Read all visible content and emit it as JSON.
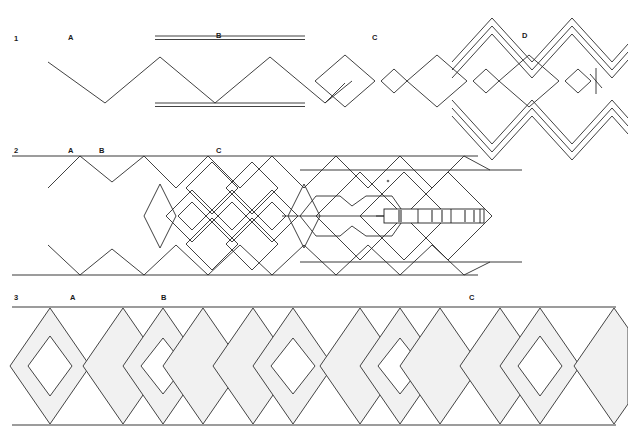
{
  "figure": {
    "background_color": "#ffffff",
    "line_color": "#2b2b2b",
    "shade_color": "#f1f1f1",
    "width": 628,
    "height": 434
  },
  "rows": [
    {
      "number": "1",
      "labels": [
        {
          "text": "A",
          "x": 68,
          "y": 40
        },
        {
          "text": "B",
          "x": 216,
          "y": 38
        },
        {
          "text": "C",
          "x": 372,
          "y": 40
        },
        {
          "text": "D",
          "x": 522,
          "y": 38
        }
      ],
      "row_number_pos": {
        "x": 14,
        "y": 41
      },
      "description": "Open zigzag chain at left, paired guide bars over region B, alternating large and small diamonds through C, nested chevron envelope with inner diamonds at D"
    },
    {
      "number": "2",
      "labels": [
        {
          "text": "A",
          "x": 68,
          "y": 153
        },
        {
          "text": "B",
          "x": 99,
          "y": 153
        },
        {
          "text": "C",
          "x": 216,
          "y": 153
        }
      ],
      "row_number_pos": {
        "x": 14,
        "y": 153
      },
      "description": "Bounded band with upper and lower rails, mirrored zigzags, dense overlapping diamond lattice, double-lobed hexagonal pointer and a segmented rectangular scale bar"
    },
    {
      "number": "3",
      "labels": [
        {
          "text": "A",
          "x": 70,
          "y": 300
        },
        {
          "text": "B",
          "x": 161,
          "y": 300
        },
        {
          "text": "C",
          "x": 469,
          "y": 300
        }
      ],
      "row_number_pos": {
        "x": 14,
        "y": 300
      },
      "description": "Bounded band of shaded diamonds alternating with open and hollow-cored diamonds"
    }
  ],
  "row1": {
    "zigzag": {
      "points": "48,62 105,103 160,57 215,103 270,57 325,103 380,57",
      "peak_y": 57,
      "valley_y": 103
    },
    "guide_bars": [
      {
        "x1": 155,
        "y1": 36,
        "x2": 305,
        "y2": 36
      },
      {
        "x1": 155,
        "y1": 39,
        "x2": 305,
        "y2": 39
      },
      {
        "x1": 155,
        "y1": 103,
        "x2": 305,
        "y2": 103
      },
      {
        "x1": 155,
        "y1": 106,
        "x2": 305,
        "y2": 106
      }
    ],
    "diamond_axis_y": 81,
    "diamonds": [
      {
        "cx": 345,
        "rx": 30,
        "ry": 26
      },
      {
        "cx": 394,
        "rx": 13,
        "ry": 12
      },
      {
        "cx": 437,
        "rx": 30,
        "ry": 26
      },
      {
        "cx": 486,
        "rx": 13,
        "ry": 12
      },
      {
        "cx": 529,
        "rx": 30,
        "ry": 26
      },
      {
        "cx": 578,
        "rx": 13,
        "ry": 12
      }
    ],
    "chevron_envelope": {
      "offsets": [
        0,
        4.5,
        9
      ],
      "upper_base": "455,58 492,16 530,58 568,16 606,58 628,36",
      "lower_base": "455,104 492,146 530,104 568,146 606,104 628,126"
    },
    "cross_mark": {
      "x": 596,
      "y": 81,
      "len": 13
    }
  },
  "row2": {
    "rails": [
      {
        "x1": 12,
        "y1": 155,
        "x2": 478,
        "y2": 155
      },
      {
        "x1": 12,
        "y1": 157,
        "x2": 478,
        "y2": 157
      },
      {
        "x1": 12,
        "y1": 274,
        "x2": 478,
        "y2": 274
      },
      {
        "x1": 12,
        "y1": 276,
        "x2": 478,
        "y2": 276
      }
    ],
    "rails_right": [
      {
        "x1": 300,
        "y1": 170,
        "x2": 520,
        "y2": 170
      },
      {
        "x1": 300,
        "y1": 262,
        "x2": 520,
        "y2": 262
      }
    ],
    "upper_zigzag": "48,188 80,156 112,181 144,156 176,188 208,156 240,188 272,156 304,188 336,156 368,188 400,156 432,188 464,156 490,170",
    "lower_zigzag": "48,245 80,274 112,248 144,274 176,245 208,274 240,245 272,274 304,245 336,274 368,245 400,274 432,245 464,274 490,262",
    "center_axis": {
      "x1": 176,
      "y1": 216,
      "x2": 478,
      "y2": 216
    },
    "lattice_diamonds": [
      {
        "cx": 192,
        "cy": 216,
        "rx": 26,
        "ry": 26
      },
      {
        "cx": 192,
        "cy": 216,
        "rx": 14,
        "ry": 14
      },
      {
        "cx": 232,
        "cy": 216,
        "rx": 26,
        "ry": 26
      },
      {
        "cx": 232,
        "cy": 216,
        "rx": 14,
        "ry": 14
      },
      {
        "cx": 212,
        "cy": 188,
        "rx": 26,
        "ry": 26
      },
      {
        "cx": 212,
        "cy": 244,
        "rx": 26,
        "ry": 26
      },
      {
        "cx": 252,
        "cy": 188,
        "rx": 26,
        "ry": 26
      },
      {
        "cx": 252,
        "cy": 244,
        "rx": 26,
        "ry": 26
      },
      {
        "cx": 272,
        "cy": 216,
        "rx": 26,
        "ry": 26
      },
      {
        "cx": 272,
        "cy": 216,
        "rx": 14,
        "ry": 14
      }
    ],
    "pointer_hexagons": [
      "300,216 316,196 340,196 352,206 366,196 392,196 406,216 392,236 366,236 352,226 340,236 316,236",
      "300,216 406,216"
    ],
    "scale_bar": {
      "x": 384,
      "y": 209,
      "width": 100,
      "height": 14,
      "segments": [
        {
          "x": 384,
          "w": 34
        },
        {
          "x": 418,
          "w": 33
        },
        {
          "x": 451,
          "w": 33
        }
      ],
      "ticks": [
        {
          "x": 398,
          "w": 4
        },
        {
          "x": 432,
          "w": 2
        },
        {
          "x": 441,
          "w": 2
        },
        {
          "x": 465,
          "w": 2
        },
        {
          "x": 474,
          "w": 2
        }
      ]
    },
    "big_diamonds_right": [
      {
        "cx": 404,
        "cy": 216,
        "rx": 44,
        "ry": 44
      },
      {
        "cx": 448,
        "cy": 216,
        "rx": 44,
        "ry": 44
      },
      {
        "cx": 360,
        "cy": 216,
        "rx": 44,
        "ry": 44
      }
    ],
    "marker_dot": {
      "x": 388,
      "y": 181
    }
  },
  "row3": {
    "rails": [
      {
        "x1": 12,
        "y1": 306,
        "x2": 616,
        "y2": 306
      },
      {
        "x1": 12,
        "y1": 308,
        "x2": 616,
        "y2": 308
      },
      {
        "x1": 12,
        "y1": 424,
        "x2": 616,
        "y2": 424
      },
      {
        "x1": 12,
        "y1": 426,
        "x2": 616,
        "y2": 426
      }
    ],
    "band_top": 308,
    "band_bottom": 424,
    "shaded_diamonds": [
      {
        "cx": 50,
        "rx": 40,
        "core": 20
      },
      {
        "cx": 123,
        "rx": 40,
        "core": 0
      },
      {
        "cx": 156,
        "rx": 40,
        "core": 22
      },
      {
        "cx": 196,
        "rx": 40,
        "core": 0
      },
      {
        "cx": 247,
        "rx": 40,
        "core": 0
      },
      {
        "cx": 290,
        "rx": 40,
        "core": 22
      },
      {
        "cx": 352,
        "rx": 40,
        "core": 0
      },
      {
        "cx": 395,
        "rx": 40,
        "core": 22
      },
      {
        "cx": 437,
        "rx": 40,
        "core": 0
      },
      {
        "cx": 490,
        "rx": 40,
        "core": 0
      },
      {
        "cx": 534,
        "rx": 40,
        "core": 22
      },
      {
        "cx": 600,
        "rx": 40,
        "core": 0
      }
    ],
    "fill": "#f1f1f1"
  }
}
